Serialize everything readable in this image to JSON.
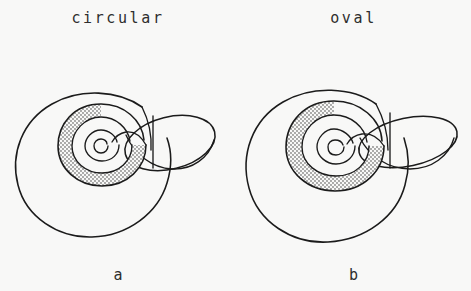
{
  "figure": {
    "background_color": "#f8f8f7",
    "ink_color": "#1b1b1b",
    "stipple_color": "#3a3a3a"
  },
  "panels": [
    {
      "id": "a",
      "top_label": "circular",
      "bottom_label": "a",
      "aperture_shape": "circular",
      "description": "coiled shell with circular whorl cross-section"
    },
    {
      "id": "b",
      "top_label": "oval",
      "bottom_label": "b",
      "aperture_shape": "oval",
      "description": "coiled shell with oval whorl cross-section"
    }
  ]
}
